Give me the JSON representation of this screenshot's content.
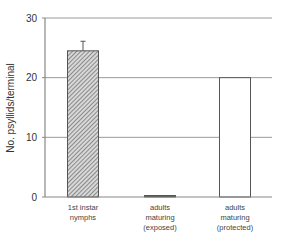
{
  "chart_data": {
    "type": "bar",
    "title": "",
    "xlabel": "",
    "ylabel": "No. psyllids/terminal",
    "ylim": [
      0,
      30
    ],
    "yticks": [
      0,
      10,
      20,
      30
    ],
    "grid": true,
    "legend": null,
    "categories": [
      [
        "1st instar",
        "nymphs"
      ],
      [
        "adults",
        "maturing",
        "(exposed)"
      ],
      [
        "adults",
        "maturing",
        "(protected)"
      ]
    ],
    "values": [
      24.5,
      0.2,
      20.0
    ],
    "error_upper": [
      26.1,
      null,
      null
    ],
    "bar_styles": [
      "hatched",
      "solid-dark",
      "white"
    ]
  },
  "colors": {
    "axis": "#888888",
    "grid": "#999999",
    "bar_edge": "#555555",
    "hatch": "#555555"
  }
}
